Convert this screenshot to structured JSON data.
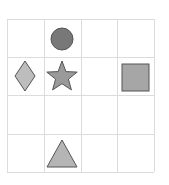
{
  "grid": {
    "rows": 4,
    "cols": 4,
    "x_lines": [
      7,
      44,
      81,
      117,
      154
    ],
    "y_lines": [
      19,
      57,
      95,
      134,
      172
    ],
    "line_color": "#dcdcdc"
  },
  "shapes": [
    {
      "type": "circle",
      "row": 0,
      "col": 1,
      "cx": 62,
      "cy": 39,
      "r": 11,
      "fill": "#787878",
      "stroke": "#555555"
    },
    {
      "type": "diamond",
      "row": 1,
      "col": 0,
      "cx": 25,
      "cy": 76,
      "hw": 10,
      "hh": 15,
      "fill": "#bdbdbd",
      "stroke": "#555555"
    },
    {
      "type": "star",
      "row": 1,
      "col": 1,
      "cx": 62,
      "cy": 77,
      "r": 16,
      "fill": "#9a9a9a",
      "stroke": "#555555"
    },
    {
      "type": "square",
      "row": 1,
      "col": 3,
      "x": 122,
      "y": 64,
      "size": 27,
      "fill": "#a6a6a6",
      "stroke": "#555555"
    },
    {
      "type": "triangle",
      "row": 3,
      "col": 1,
      "points": "62,140 47,167 77,167",
      "fill": "#b5b5b5",
      "stroke": "#555555"
    }
  ]
}
